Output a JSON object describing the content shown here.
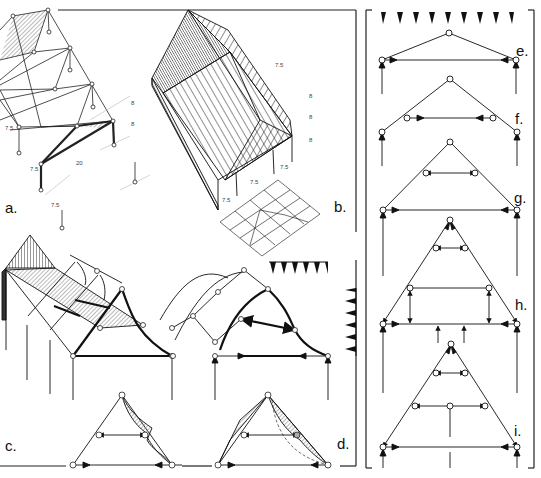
{
  "figure": {
    "panels": [
      {
        "id": "a",
        "label": "a.",
        "description": "Isometric space-frame of pitched roof trusses on columns"
      },
      {
        "id": "b",
        "label": "b.",
        "description": "Isometric hipped roof with rafters, and plan of hip roof framing"
      },
      {
        "id": "c",
        "label": "c.",
        "description": "Roof truss with bending moment diagram, isometric frame with shaded roof plane"
      },
      {
        "id": "d",
        "label": "d.",
        "description": "Arched truss frames with load arrows and bending moment diagram"
      },
      {
        "id": "e",
        "label": "e.",
        "description": "Shallow triangular truss with tie"
      },
      {
        "id": "f",
        "label": "f.",
        "description": "Triangular truss with raised collar tie"
      },
      {
        "id": "g",
        "label": "g.",
        "description": "Triangular truss with collar tie and base tie"
      },
      {
        "id": "h",
        "label": "h.",
        "description": "Triangular truss with collar, frame posts and base tie"
      },
      {
        "id": "i",
        "label": "i.",
        "description": "Triangular truss with two ties and king post"
      }
    ],
    "dimensions": {
      "a": [
        "7.5",
        "7.5",
        "20",
        "7.5",
        "8",
        "8"
      ],
      "b": [
        "7.5",
        "7.5",
        "7.5",
        "8",
        "8",
        "8",
        "7.5"
      ]
    },
    "load_indicators": {
      "top_row_triangles": 9,
      "middle_row_triangles": 6,
      "side_column_triangles": 6
    },
    "colors": {
      "line": "#111111",
      "hatch": "#9a9a9a",
      "shade": "#bdbdbd",
      "node_fill": "#ffffff"
    }
  }
}
